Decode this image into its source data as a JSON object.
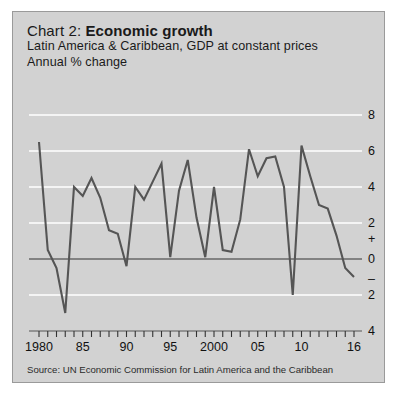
{
  "panel": {
    "background_color": "#d2d2d2",
    "border_color": "#9a9a9a"
  },
  "header": {
    "chart_label": "Chart 2:",
    "title": "Economic growth",
    "subtitle_1": "Latin America & Caribbean, GDP at constant prices",
    "subtitle_2": "Annual % change"
  },
  "source": {
    "text": "Source: UN Economic Commission for Latin America and the Caribbean"
  },
  "axis": {
    "y_ticks": [
      "8",
      "6",
      "4",
      "2",
      "+",
      "0",
      "–",
      "2",
      "4"
    ],
    "x_ticks": [
      "1980",
      "85",
      "90",
      "95",
      "2000",
      "05",
      "10",
      "16"
    ],
    "gridline_color": "#ffffff",
    "zeroline_color": "#333333",
    "line_color": "#555555"
  },
  "chart_data": {
    "type": "line",
    "title": "Chart 2: Economic growth",
    "subtitle": "Latin America & Caribbean, GDP at constant prices",
    "xlabel": "",
    "ylabel": "Annual % change",
    "ylim": [
      -4,
      8
    ],
    "xlim": [
      1980,
      2016
    ],
    "grid": true,
    "legend": "none",
    "yticks": [
      -4,
      -2,
      0,
      2,
      4,
      6,
      8
    ],
    "ytick_labels": [
      "4",
      "2",
      "0",
      "2",
      "4",
      "6",
      "8"
    ],
    "xticks": [
      1980,
      1985,
      1990,
      1995,
      2000,
      2005,
      2010,
      2016
    ],
    "xtick_labels": [
      "1980",
      "85",
      "90",
      "95",
      "2000",
      "05",
      "10",
      "16"
    ],
    "x": [
      1980,
      1981,
      1982,
      1983,
      1984,
      1985,
      1986,
      1987,
      1988,
      1989,
      1990,
      1991,
      1992,
      1993,
      1994,
      1995,
      1996,
      1997,
      1998,
      1999,
      2000,
      2001,
      2002,
      2003,
      2004,
      2005,
      2006,
      2007,
      2008,
      2009,
      2010,
      2011,
      2012,
      2013,
      2014,
      2015,
      2016
    ],
    "values": [
      6.5,
      0.5,
      -0.5,
      -3.0,
      4.0,
      3.5,
      4.5,
      3.4,
      1.6,
      1.4,
      -0.4,
      4.0,
      3.3,
      4.3,
      5.3,
      0.1,
      3.8,
      5.5,
      2.3,
      0.1,
      4.0,
      0.5,
      0.4,
      2.2,
      6.1,
      4.6,
      5.6,
      5.7,
      4.0,
      -2.0,
      6.3,
      4.6,
      3.0,
      2.8,
      1.3,
      -0.5,
      -1.0
    ],
    "series": [
      {
        "name": "GDP growth",
        "values": [
          6.5,
          0.5,
          -0.5,
          -3.0,
          4.0,
          3.5,
          4.5,
          3.4,
          1.6,
          1.4,
          -0.4,
          4.0,
          3.3,
          4.3,
          5.3,
          0.1,
          3.8,
          5.5,
          2.3,
          0.1,
          4.0,
          0.5,
          0.4,
          2.2,
          6.1,
          4.6,
          5.6,
          5.7,
          4.0,
          -2.0,
          6.3,
          4.6,
          3.0,
          2.8,
          1.3,
          -0.5,
          -1.0
        ]
      }
    ]
  }
}
